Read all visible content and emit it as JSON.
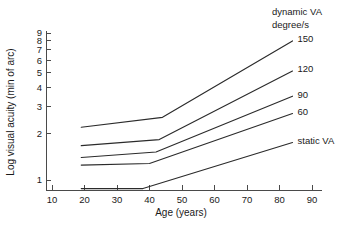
{
  "chart_data": {
    "type": "line",
    "title": "",
    "xlabel": "Age (years)",
    "ylabel": "Log visual acuity (min of arc)",
    "yscale": "log",
    "xlim": [
      5,
      95
    ],
    "ylim": [
      0.78,
      9.6
    ],
    "grid": false,
    "legend_position": "right-of-plot-line-ends",
    "legend_heading": [
      "dynamic VA",
      "degree/s"
    ],
    "xticks": [
      10,
      20,
      30,
      40,
      50,
      60,
      70,
      80,
      90
    ],
    "xtick_labels": [
      "10",
      "20",
      "30",
      "40",
      "50",
      "60",
      "70",
      "80",
      "90"
    ],
    "yticks": [
      1,
      2,
      3,
      4,
      5,
      6,
      7,
      8,
      9
    ],
    "ytick_labels": [
      "1",
      "2",
      "3",
      "4",
      "5",
      "6",
      "7",
      "8",
      "9"
    ],
    "series": [
      {
        "name": "150",
        "label": "150",
        "x": [
          19,
          44,
          84
        ],
        "y": [
          2.2,
          2.55,
          8.0
        ]
      },
      {
        "name": "120",
        "label": "120",
        "x": [
          19,
          43,
          84
        ],
        "y": [
          1.67,
          1.83,
          5.1
        ]
      },
      {
        "name": "90",
        "label": "90",
        "x": [
          19,
          42,
          84
        ],
        "y": [
          1.4,
          1.52,
          3.5
        ]
      },
      {
        "name": "60",
        "label": "60",
        "x": [
          19,
          40,
          84
        ],
        "y": [
          1.25,
          1.28,
          2.7
        ]
      },
      {
        "name": "static VA",
        "label": "static VA",
        "x": [
          19,
          38,
          84
        ],
        "y": [
          0.88,
          0.88,
          1.75
        ]
      }
    ]
  },
  "colors": {
    "line": "#2b2b2b",
    "axis": "#4a4a4a",
    "text": "#1a1a1a",
    "background": "#ffffff"
  }
}
